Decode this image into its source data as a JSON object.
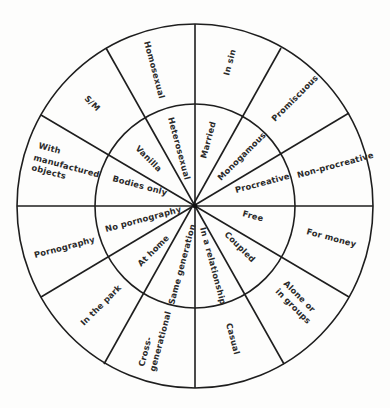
{
  "diagram": {
    "type": "concentric-wheel",
    "center": [
      195,
      206
    ],
    "outer_radius": [
      178,
      182
    ],
    "inner_radius": [
      100,
      102
    ],
    "line_color": "#1e1e1e",
    "text_color": "#2a2a2a",
    "segments": [
      {
        "inner": "Procreative",
        "outer": "Non-procreative"
      },
      {
        "inner": "Monogamous",
        "outer": "Promiscuous"
      },
      {
        "inner": "Married",
        "outer": "In sin"
      },
      {
        "inner": "Heterosexual",
        "outer": "Homosexual"
      },
      {
        "inner": "Vanilla",
        "outer": "S/M"
      },
      {
        "inner": "Bodies only",
        "outer": "With manufactured objects"
      },
      {
        "inner": "No pornography",
        "outer": "Pornography"
      },
      {
        "inner": "At home",
        "outer": "In the park"
      },
      {
        "inner": "Same generation",
        "outer": "Cross-generational"
      },
      {
        "inner": "In a relationship",
        "outer": "Casual"
      },
      {
        "inner": "Coupled",
        "outer": "Alone or in groups"
      },
      {
        "inner": "Free",
        "outer": "For money"
      }
    ],
    "labels": {
      "procreative": "Procreative",
      "non_procreative": "Non-procreative",
      "monogamous": "Monogamous",
      "promiscuous": "Promiscuous",
      "married": "Married",
      "in_sin": "In sin",
      "heterosexual": "Heterosexual",
      "homosexual": "Homosexual",
      "vanilla": "Vanilla",
      "sm": "S/M",
      "bodies_only": "Bodies only",
      "with_objects_1": "With",
      "with_objects_2": "manufactured",
      "with_objects_3": "objects",
      "no_pornography": "No pornography",
      "pornography": "Pornography",
      "at_home": "At home",
      "in_the_park": "In the park",
      "same_generation": "Same generation",
      "cross_gen_1": "Cross-",
      "cross_gen_2": "generational",
      "in_a_relationship": "In a relationship",
      "casual": "Casual",
      "coupled": "Coupled",
      "alone_1": "Alone or",
      "alone_2": "in groups",
      "free": "Free",
      "for_money": "For money"
    }
  }
}
